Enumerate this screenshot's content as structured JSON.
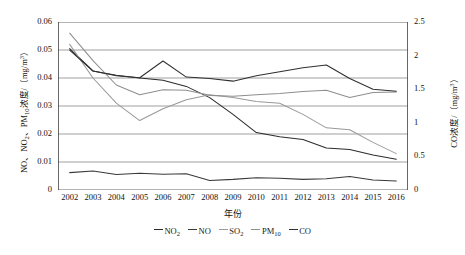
{
  "chart_data": {
    "type": "line",
    "title": "",
    "xlabel": "年份",
    "ylabel": "NO、NO2、PM10浓度/（mg/m3）",
    "ylabel_right": "CO浓度/（mg/m3）",
    "categories": [
      "2002",
      "2003",
      "2004",
      "2005",
      "2006",
      "2007",
      "2008",
      "2009",
      "2010",
      "2011",
      "2012",
      "2013",
      "2014",
      "2015",
      "2016"
    ],
    "ylim": [
      0,
      0.06
    ],
    "yticks": [
      "0",
      "0.01",
      "0.02",
      "0.03",
      "0.04",
      "0.05",
      "0.06"
    ],
    "ylim_right": [
      0,
      2.5
    ],
    "yticks_right": [
      "0",
      "0.5",
      "1",
      "1.5",
      "2",
      "2.5"
    ],
    "grid": true,
    "legend_position": "bottom",
    "series": [
      {
        "name": "NO2",
        "axis": "left",
        "color": "#2b2b2b",
        "values": [
          0.0505,
          0.0425,
          0.041,
          0.04,
          0.0392,
          0.037,
          0.033,
          0.027,
          0.0205,
          0.019,
          0.018,
          0.015,
          0.0145,
          0.0125,
          0.011
        ]
      },
      {
        "name": "NO",
        "axis": "left",
        "color": "#3a3a3a",
        "values": [
          0.0062,
          0.0068,
          0.0055,
          0.006,
          0.0056,
          0.0058,
          0.0034,
          0.0038,
          0.0044,
          0.0042,
          0.0038,
          0.004,
          0.0048,
          0.0036,
          0.0032
        ]
      },
      {
        "name": "SO2",
        "axis": "left",
        "color": "#9a9a9a",
        "values": [
          0.052,
          0.04,
          0.031,
          0.0248,
          0.029,
          0.0322,
          0.034,
          0.033,
          0.0316,
          0.031,
          0.027,
          0.0222,
          0.0215,
          0.017,
          0.013
        ]
      },
      {
        "name": "PM10",
        "axis": "left",
        "color": "#8f8f8f",
        "values": [
          0.056,
          0.0462,
          0.0375,
          0.034,
          0.0358,
          0.0356,
          0.0338,
          0.0335,
          0.034,
          0.0345,
          0.0352,
          0.0356,
          0.033,
          0.0348,
          0.035
        ]
      },
      {
        "name": "CO",
        "axis": "right",
        "color": "#303030",
        "values": [
          2.08,
          1.77,
          1.7,
          1.67,
          1.92,
          1.68,
          1.66,
          1.62,
          1.7,
          1.76,
          1.82,
          1.86,
          1.66,
          1.5,
          1.47
        ]
      }
    ],
    "legend": [
      {
        "label": "NO2",
        "base": "NO",
        "sub": "2"
      },
      {
        "label": "NO",
        "base": "NO",
        "sub": ""
      },
      {
        "label": "SO2",
        "base": "SO",
        "sub": "2"
      },
      {
        "label": "PM10",
        "base": "PM",
        "sub": "10"
      },
      {
        "label": "CO",
        "base": "CO",
        "sub": ""
      }
    ]
  },
  "axes": {
    "left_title_parts": {
      "pre": "NO、NO",
      "sub1": "2",
      "mid": "、PM",
      "sub2": "10",
      "post": "浓度/（mg/m",
      "sup": "3",
      "end": "）"
    },
    "right_title_parts": {
      "pre": "CO浓度/（mg/m",
      "sup": "3",
      "end": "）"
    },
    "x_title": "年份"
  }
}
